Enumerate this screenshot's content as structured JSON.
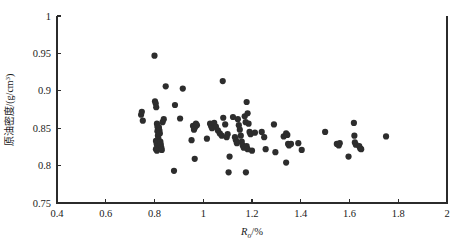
{
  "chart_data": {
    "type": "scatter",
    "title": "",
    "xlabel": "Ro/%",
    "xlabel_main": "R",
    "xlabel_sub": "o",
    "xlabel_tail": "/%",
    "ylabel": "原油密度/(g/cm³)",
    "ylabel_cn": "原油密度",
    "ylabel_unit": "/(g/cm",
    "ylabel_unit_sup": "3",
    "ylabel_unit_tail": ")",
    "xlim": [
      0.4,
      2.0
    ],
    "ylim": [
      0.75,
      1.0
    ],
    "xticks": [
      0.4,
      0.6,
      0.8,
      1.0,
      1.2,
      1.4,
      1.6,
      1.8,
      2.0
    ],
    "xticklabels": [
      "0.4",
      "0.6",
      "0.8",
      "1",
      "1.2",
      "1.4",
      "1.6",
      "1.8",
      "2"
    ],
    "yticks": [
      0.75,
      0.8,
      0.85,
      0.9,
      0.95,
      1.0
    ],
    "yticklabels": [
      "0.75",
      "0.8",
      "0.85",
      "0.9",
      "0.95",
      "1"
    ],
    "grid": false,
    "legend": false,
    "marker": "filled-circle",
    "marker_color": "#2d2d2d",
    "marker_size": 3.1,
    "series": [
      {
        "name": "crude oil density vs Ro",
        "points": [
          [
            0.745,
            0.868
          ],
          [
            0.748,
            0.872
          ],
          [
            0.752,
            0.86
          ],
          [
            0.8,
            0.947
          ],
          [
            0.802,
            0.886
          ],
          [
            0.805,
            0.883
          ],
          [
            0.807,
            0.878
          ],
          [
            0.81,
            0.856
          ],
          [
            0.812,
            0.852
          ],
          [
            0.812,
            0.846
          ],
          [
            0.814,
            0.84
          ],
          [
            0.816,
            0.836
          ],
          [
            0.806,
            0.833
          ],
          [
            0.809,
            0.829
          ],
          [
            0.812,
            0.826
          ],
          [
            0.815,
            0.824
          ],
          [
            0.806,
            0.822
          ],
          [
            0.81,
            0.82
          ],
          [
            0.818,
            0.851
          ],
          [
            0.82,
            0.847
          ],
          [
            0.822,
            0.843
          ],
          [
            0.824,
            0.832
          ],
          [
            0.826,
            0.828
          ],
          [
            0.828,
            0.824
          ],
          [
            0.83,
            0.821
          ],
          [
            0.833,
            0.858
          ],
          [
            0.838,
            0.862
          ],
          [
            0.846,
            0.906
          ],
          [
            0.88,
            0.793
          ],
          [
            0.884,
            0.881
          ],
          [
            0.905,
            0.863
          ],
          [
            0.916,
            0.903
          ],
          [
            0.952,
            0.834
          ],
          [
            0.958,
            0.853
          ],
          [
            0.962,
            0.848
          ],
          [
            0.966,
            0.851
          ],
          [
            0.97,
            0.856
          ],
          [
            0.974,
            0.854
          ],
          [
            0.965,
            0.809
          ],
          [
            1.015,
            0.836
          ],
          [
            1.028,
            0.856
          ],
          [
            1.032,
            0.853
          ],
          [
            1.036,
            0.85
          ],
          [
            1.045,
            0.857
          ],
          [
            1.052,
            0.852
          ],
          [
            1.06,
            0.847
          ],
          [
            1.068,
            0.843
          ],
          [
            1.076,
            0.84
          ],
          [
            1.08,
            0.913
          ],
          [
            1.082,
            0.864
          ],
          [
            1.09,
            0.855
          ],
          [
            1.096,
            0.838
          ],
          [
            1.1,
            0.842
          ],
          [
            1.108,
            0.812
          ],
          [
            1.104,
            0.791
          ],
          [
            1.122,
            0.865
          ],
          [
            1.13,
            0.838
          ],
          [
            1.134,
            0.834
          ],
          [
            1.138,
            0.83
          ],
          [
            1.142,
            0.862
          ],
          [
            1.146,
            0.854
          ],
          [
            1.15,
            0.848
          ],
          [
            1.154,
            0.84
          ],
          [
            1.158,
            0.832
          ],
          [
            1.162,
            0.827
          ],
          [
            1.166,
            0.824
          ],
          [
            1.17,
            0.866
          ],
          [
            1.174,
            0.858
          ],
          [
            1.178,
            0.885
          ],
          [
            1.182,
            0.87
          ],
          [
            1.186,
            0.856
          ],
          [
            1.19,
            0.845
          ],
          [
            1.194,
            0.842
          ],
          [
            1.178,
            0.826
          ],
          [
            1.182,
            0.822
          ],
          [
            1.175,
            0.791
          ],
          [
            1.2,
            0.82
          ],
          [
            1.212,
            0.844
          ],
          [
            1.24,
            0.845
          ],
          [
            1.25,
            0.838
          ],
          [
            1.256,
            0.822
          ],
          [
            1.29,
            0.855
          ],
          [
            1.296,
            0.818
          ],
          [
            1.33,
            0.839
          ],
          [
            1.34,
            0.843
          ],
          [
            1.345,
            0.841
          ],
          [
            1.348,
            0.829
          ],
          [
            1.352,
            0.827
          ],
          [
            1.34,
            0.804
          ],
          [
            1.36,
            0.829
          ],
          [
            1.39,
            0.83
          ],
          [
            1.404,
            0.821
          ],
          [
            1.5,
            0.845
          ],
          [
            1.548,
            0.829
          ],
          [
            1.556,
            0.827
          ],
          [
            1.56,
            0.83
          ],
          [
            1.596,
            0.812
          ],
          [
            1.618,
            0.857
          ],
          [
            1.62,
            0.84
          ],
          [
            1.622,
            0.831
          ],
          [
            1.626,
            0.828
          ],
          [
            1.64,
            0.826
          ],
          [
            1.644,
            0.823
          ],
          [
            1.648,
            0.822
          ],
          [
            1.75,
            0.839
          ]
        ]
      }
    ]
  },
  "plot_geometry": {
    "left": 57,
    "right": 447,
    "top": 16,
    "bottom": 203
  }
}
